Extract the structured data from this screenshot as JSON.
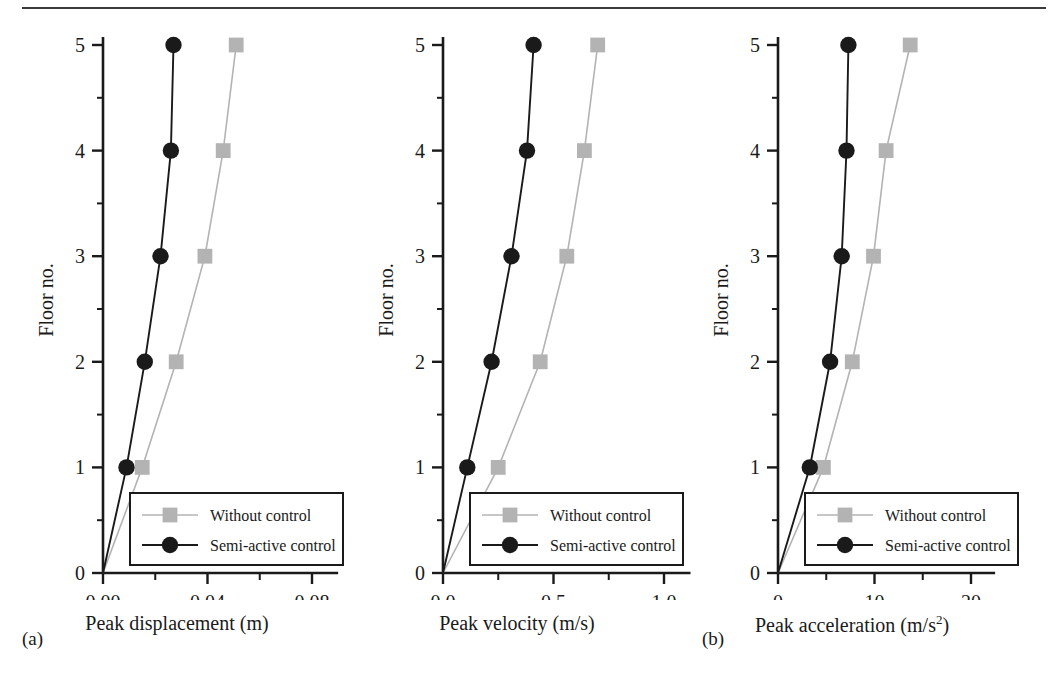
{
  "figure": {
    "y_axis_label": "Floor no.",
    "y_tick_labels": [
      "0",
      "1",
      "2",
      "3",
      "4",
      "5"
    ],
    "legend": {
      "without_control": "Without control",
      "semi_active_control": "Semi-active control"
    },
    "colors": {
      "without_control": "#b3b3b3",
      "semi_active_control": "#1a1a1a",
      "axis": "#1a1a1a",
      "rule": "#3a3a3a",
      "background": "#ffffff"
    }
  },
  "panels": [
    {
      "tag": "(a)",
      "xlabel": "Peak displacement (m)"
    },
    {
      "tag": "(b)",
      "xlabel": "Peak velocity (m/s)"
    },
    {
      "tag": "(c)",
      "xlabel": "Peak acceleration (m/s"
    }
  ],
  "chart_data": [
    {
      "type": "line",
      "panel": "(a)",
      "title": "",
      "xlabel": "Peak displacement (m)",
      "ylabel": "Floor no.",
      "xlim": [
        0.0,
        0.09
      ],
      "ylim": [
        0,
        5.35
      ],
      "xticks": [
        0.0,
        0.02,
        0.04,
        0.06,
        0.08
      ],
      "xtick_labels": [
        "0.00",
        "",
        "0.04",
        "",
        "0.08"
      ],
      "yticks": [
        0,
        0.5,
        1,
        1.5,
        2,
        2.5,
        3,
        3.5,
        4,
        4.5,
        5
      ],
      "ytick_labels": [
        "0",
        "",
        "1",
        "",
        "2",
        "",
        "3",
        "",
        "4",
        "",
        "5"
      ],
      "grid": false,
      "legend_position": "lower right",
      "floors": [
        0,
        1,
        2,
        3,
        4,
        5
      ],
      "series": [
        {
          "name": "Without control",
          "marker": "square",
          "color": "#b3b3b3",
          "values": [
            0.0,
            0.015,
            0.028,
            0.039,
            0.046,
            0.051
          ]
        },
        {
          "name": "Semi-active control",
          "marker": "circle",
          "color": "#1a1a1a",
          "values": [
            0.0,
            0.009,
            0.016,
            0.022,
            0.026,
            0.027
          ]
        }
      ]
    },
    {
      "type": "line",
      "panel": "(b)",
      "title": "",
      "xlabel": "Peak velocity (m/s)",
      "ylabel": "Floor no.",
      "xlim": [
        0.0,
        1.12
      ],
      "ylim": [
        0,
        5.35
      ],
      "xticks": [
        0.0,
        0.25,
        0.5,
        0.75,
        1.0
      ],
      "xtick_labels": [
        "0.0",
        "",
        "0.5",
        "",
        "1.0"
      ],
      "yticks": [
        0,
        0.5,
        1,
        1.5,
        2,
        2.5,
        3,
        3.5,
        4,
        4.5,
        5
      ],
      "ytick_labels": [
        "0",
        "",
        "1",
        "",
        "2",
        "",
        "3",
        "",
        "4",
        "",
        "5"
      ],
      "grid": false,
      "legend_position": "lower right",
      "floors": [
        0,
        1,
        2,
        3,
        4,
        5
      ],
      "series": [
        {
          "name": "Without control",
          "marker": "square",
          "color": "#b3b3b3",
          "values": [
            0.0,
            0.25,
            0.44,
            0.56,
            0.64,
            0.7
          ]
        },
        {
          "name": "Semi-active control",
          "marker": "circle",
          "color": "#1a1a1a",
          "values": [
            0.0,
            0.11,
            0.22,
            0.31,
            0.38,
            0.41
          ]
        }
      ]
    },
    {
      "type": "line",
      "panel": "(c)",
      "title": "",
      "xlabel": "Peak acceleration (m/s2)",
      "ylabel": "Floor no.",
      "xlim": [
        0,
        22.5
      ],
      "ylim": [
        0,
        5.35
      ],
      "xticks": [
        0,
        5,
        10,
        15,
        20
      ],
      "xtick_labels": [
        "0",
        "",
        "10",
        "",
        "20"
      ],
      "yticks": [
        0,
        0.5,
        1,
        1.5,
        2,
        2.5,
        3,
        3.5,
        4,
        4.5,
        5
      ],
      "ytick_labels": [
        "0",
        "",
        "1",
        "",
        "2",
        "",
        "3",
        "",
        "4",
        "",
        "5"
      ],
      "grid": false,
      "legend_position": "lower right",
      "floors": [
        0,
        1,
        2,
        3,
        4,
        5
      ],
      "series": [
        {
          "name": "Without control",
          "marker": "square",
          "color": "#b3b3b3",
          "values": [
            0.0,
            4.7,
            7.7,
            9.9,
            11.2,
            13.7
          ]
        },
        {
          "name": "Semi-active control",
          "marker": "circle",
          "color": "#1a1a1a",
          "values": [
            0.0,
            3.3,
            5.4,
            6.6,
            7.1,
            7.3
          ]
        }
      ]
    }
  ]
}
